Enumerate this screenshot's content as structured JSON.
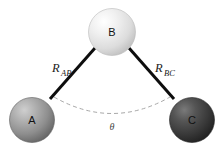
{
  "figure": {
    "background_color": "#ffffff",
    "atoms": [
      {
        "id": "A",
        "label": "A",
        "cx": 32,
        "cy": 120,
        "r": 22.5,
        "shade_light": "#c9c9c9",
        "shade_mid": "#9a9a9a",
        "shade_dark": "#6e6e6e",
        "edge": "#5c5c5c"
      },
      {
        "id": "B",
        "label": "B",
        "cx": 112,
        "cy": 32,
        "r": 23.5,
        "shade_light": "#ffffff",
        "shade_mid": "#e3e3e3",
        "shade_dark": "#c2c2c2",
        "edge": "#b0b0b0"
      },
      {
        "id": "C",
        "label": "C",
        "cx": 192,
        "cy": 120,
        "r": 22.5,
        "shade_light": "#6b6b6b",
        "shade_mid": "#484848",
        "shade_dark": "#2a2a2a",
        "edge": "#242424"
      }
    ],
    "bonds": [
      {
        "id": "AB",
        "label_main": "R",
        "label_sub": "AB",
        "label_x": 52,
        "label_y": 72,
        "x1": 95,
        "y1": 48,
        "x2": 50,
        "y2": 99,
        "color": "#0d0d0d"
      },
      {
        "id": "BC",
        "label_main": "R",
        "label_sub": "BC",
        "label_x": 155,
        "label_y": 72,
        "x1": 129,
        "y1": 48,
        "x2": 174,
        "y2": 99,
        "color": "#0d0d0d"
      }
    ],
    "angle": {
      "symbol": "θ",
      "label_x": 112,
      "label_y": 127,
      "arc_path": "M 54 97 Q 112 130 170 97",
      "arc_color": "#a8a8a8",
      "dash_pattern": "4 3"
    }
  }
}
